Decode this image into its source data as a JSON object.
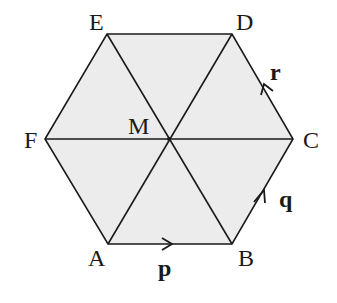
{
  "diagram": {
    "fill_color": "#ececec",
    "line_color": "#1a1a1a",
    "vertices": {
      "A": {
        "label": "A",
        "x": 108,
        "y": 244
      },
      "B": {
        "label": "B",
        "x": 232,
        "y": 244
      },
      "C": {
        "label": "C",
        "x": 293,
        "y": 139
      },
      "D": {
        "label": "D",
        "x": 232,
        "y": 34
      },
      "E": {
        "label": "E",
        "x": 107,
        "y": 34
      },
      "F": {
        "label": "F",
        "x": 45,
        "y": 139
      },
      "M": {
        "label": "M",
        "x": 169,
        "y": 139
      }
    },
    "vectors": {
      "p": {
        "label": "p",
        "from": "A",
        "to": "B"
      },
      "q": {
        "label": "q",
        "from": "B",
        "to": "C"
      },
      "r": {
        "label": "r",
        "from": "C",
        "to": "D"
      }
    }
  }
}
